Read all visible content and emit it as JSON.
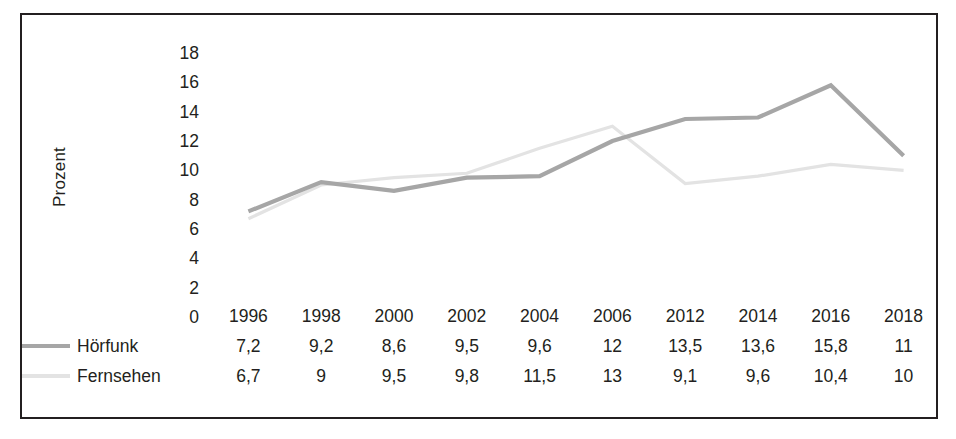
{
  "chart_data": {
    "type": "line",
    "title": "",
    "xlabel": "",
    "ylabel": "Prozent",
    "categories": [
      "1996",
      "1998",
      "2000",
      "2002",
      "2004",
      "2006",
      "2012",
      "2014",
      "2016",
      "2018"
    ],
    "ylim": [
      0,
      18
    ],
    "yticks": [
      18,
      16,
      14,
      12,
      10,
      8,
      6,
      4,
      2,
      0
    ],
    "grid": false,
    "legend_position": "bottom-left-table",
    "series": [
      {
        "name": "Hörfunk",
        "color": "#a6a6a6",
        "style": "solid",
        "values": [
          7.2,
          9.2,
          8.6,
          9.5,
          9.6,
          12,
          13.5,
          13.6,
          15.8,
          11
        ],
        "value_labels": [
          "7,2",
          "9,2",
          "8,6",
          "9,5",
          "9,6",
          "12",
          "13,5",
          "13,6",
          "15,8",
          "11"
        ]
      },
      {
        "name": "Fernsehen",
        "color": "#e3e3e3",
        "style": "solid",
        "values": [
          6.7,
          9,
          9.5,
          9.8,
          11.5,
          13,
          9.1,
          9.6,
          10.4,
          10
        ],
        "value_labels": [
          "6,7",
          "9",
          "9,5",
          "9,8",
          "11,5",
          "13",
          "9,1",
          "9,6",
          "10,4",
          "10"
        ]
      }
    ]
  },
  "frame": {
    "border_color": "#231f20",
    "background": "#ffffff"
  }
}
